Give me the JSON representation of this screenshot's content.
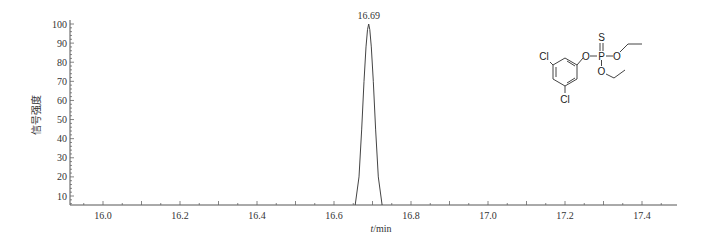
{
  "chart_data": {
    "type": "line",
    "title": "",
    "xlabel_italic": "t",
    "xlabel_unit": "/min",
    "ylabel": "信号强度",
    "xlim": [
      15.89,
      17.49
    ],
    "ylim": [
      5,
      100
    ],
    "x_ticks": [
      16.0,
      16.2,
      16.4,
      16.6,
      16.8,
      17.0,
      17.2,
      17.4
    ],
    "x_tick_labels": [
      "16.0",
      "16.2",
      "16.4",
      "16.6",
      "16.8",
      "17.0",
      "17.2",
      "17.4"
    ],
    "y_ticks": [
      10,
      20,
      30,
      40,
      50,
      60,
      70,
      80,
      90,
      100
    ],
    "y_tick_labels": [
      "10",
      "20",
      "30",
      "40",
      "50",
      "60",
      "70",
      "80",
      "90",
      "100"
    ],
    "grid": false,
    "legend": null,
    "series": [
      {
        "name": "chromatogram",
        "x": [
          16.655,
          16.665,
          16.672,
          16.678,
          16.683,
          16.687,
          16.69,
          16.693,
          16.697,
          16.702,
          16.708,
          16.715,
          16.725
        ],
        "y": [
          0,
          20,
          45,
          70,
          88,
          97,
          100,
          97,
          88,
          70,
          45,
          20,
          0
        ]
      }
    ],
    "annotations": [
      {
        "text": "16.69",
        "x": 16.69,
        "y": 100
      }
    ],
    "inset": {
      "type": "chemical-structure",
      "labels": [
        "Cl",
        "Cl",
        "O",
        "P",
        "S",
        "O",
        "O"
      ]
    }
  },
  "peak_label": "16.69",
  "axes": {
    "ylabel": "信号强度",
    "xlabel_italic": "t",
    "xlabel_unit": "/min"
  },
  "structure": {
    "cl_top": "Cl",
    "cl_bottom": "Cl",
    "o_aryl": "O",
    "p": "P",
    "s": "S",
    "o_right": "O",
    "o_down": "O"
  }
}
